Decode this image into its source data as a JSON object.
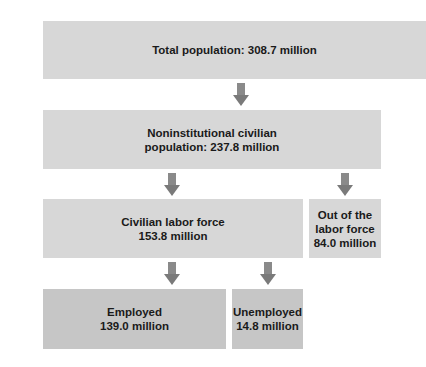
{
  "diagram": {
    "type": "flowchart",
    "nodes": {
      "total": {
        "line1": "Total population: 308.7 million"
      },
      "noninst": {
        "line1": "Noninstitutional civilian",
        "line2": "population: 237.8 million"
      },
      "labor": {
        "line1": "Civilian labor force",
        "line2": "153.8 million"
      },
      "out": {
        "line1": "Out of the",
        "line2": "labor force",
        "line3": "84.0 million"
      },
      "employed": {
        "line1": "Employed",
        "line2": "139.0 million"
      },
      "unemployed": {
        "line1": "Unemployed",
        "line2": "14.8 million"
      }
    },
    "edges": [
      {
        "from": "total",
        "to": "noninst"
      },
      {
        "from": "noninst",
        "to": "labor"
      },
      {
        "from": "noninst",
        "to": "out"
      },
      {
        "from": "labor",
        "to": "employed"
      },
      {
        "from": "labor",
        "to": "unemployed"
      }
    ],
    "colors": {
      "box_light": "#d7d7d7",
      "box_dark": "#c6c6c6",
      "arrow": "#808080"
    }
  }
}
